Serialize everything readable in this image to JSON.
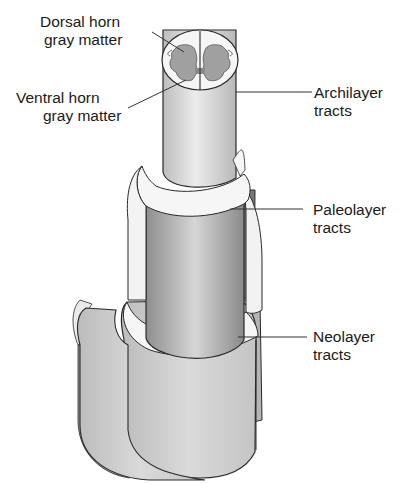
{
  "figure": {
    "type": "anatomical-diagram",
    "colors": {
      "background": "#ffffff",
      "outline": "#2a2a2a",
      "gray_matter": "#9a9a9a",
      "white_cap": "#f4f4f4",
      "archilayer_fill": "#d8d8d8",
      "paleolayer_fill": "#a9a9a9",
      "neolayer_fill": "#c8c8c8",
      "groove_dark": "#7a7a7a",
      "leader_line": "#333333"
    }
  },
  "labels": {
    "dorsal_horn": {
      "line1": "Dorsal horn",
      "line2": "gray matter"
    },
    "ventral_horn": {
      "line1": "Ventral horn",
      "line2": "gray matter"
    },
    "archilayer": {
      "line1": "Archilayer",
      "line2": "tracts"
    },
    "paleolayer": {
      "line1": "Paleolayer",
      "line2": "tracts"
    },
    "neolayer": {
      "line1": "Neolayer",
      "line2": "tracts"
    }
  }
}
